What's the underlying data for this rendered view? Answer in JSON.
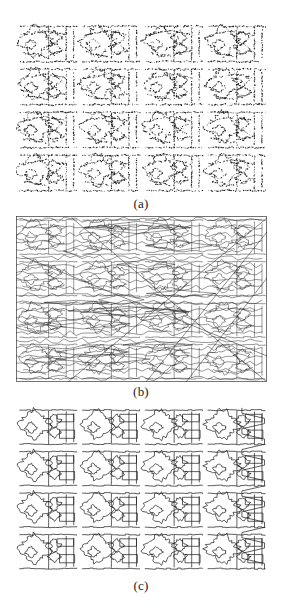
{
  "figure": {
    "background_color": "#ffffff",
    "ink_color": "#1a1a1a",
    "width": 282,
    "height": 616,
    "panel_count": 3
  },
  "captions": {
    "a": "(a)",
    "b": "(b)",
    "c": "(c)"
  },
  "panels": [
    {
      "id": "a",
      "label": "(a)",
      "kind": "stippled-point-texture",
      "description": "Sparse dotted / stippled rendering of a repeating textile motif arranged in a 4-row by 4-column tiling.",
      "bounds": {
        "x": 16,
        "y": 22,
        "width": 251,
        "height": 172
      },
      "tile_rows": 4,
      "tile_cols": 4,
      "stroke_color": "#1a1a1a",
      "stroke_width": 0.5,
      "dot_density": "high",
      "dot_radius": 0.42
    },
    {
      "id": "b",
      "label": "(b)",
      "kind": "connected-contour-network",
      "description": "Dense network of linked contour fragments spanning the full field, overlaid with long straight diagonal chords crossing the image.",
      "bounds": {
        "x": 16,
        "y": 216,
        "width": 251,
        "height": 166
      },
      "tile_rows": 4,
      "tile_cols": 4,
      "stroke_color": "#1a1a1a",
      "stroke_width": 0.45,
      "has_long_diagonals": true,
      "diagonal_count": 5,
      "border": true
    },
    {
      "id": "c",
      "label": "(c)",
      "kind": "closed-contour-outlines",
      "description": "Clean closed boundary contours of the repeating motif, with rectangular stepped connectors between tiles.",
      "bounds": {
        "x": 16,
        "y": 406,
        "width": 251,
        "height": 166
      },
      "tile_rows": 4,
      "tile_cols": 4,
      "stroke_color": "#1a1a1a",
      "stroke_width": 0.7,
      "has_long_diagonals": false,
      "border": false
    }
  ]
}
